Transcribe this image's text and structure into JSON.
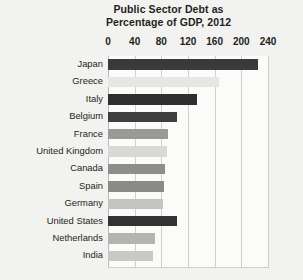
{
  "chart_data": {
    "type": "bar",
    "orientation": "horizontal",
    "title": "Public Sector Debt as Percentage of GDP, 2012",
    "title_lines": [
      "Public Sector Debt as",
      "Percentage of GDP, 2012"
    ],
    "xlabel": "",
    "ylabel": "",
    "xlim": [
      0,
      240
    ],
    "xticks": [
      0,
      40,
      80,
      120,
      160,
      200,
      240
    ],
    "xtick_labels": [
      "0",
      "40",
      "80",
      "120",
      "160",
      "200",
      "240"
    ],
    "grid": true,
    "grid_axis": "x",
    "legend": false,
    "categories": [
      "Japan",
      "Greece",
      "Italy",
      "Belgium",
      "France",
      "United Kingdom",
      "Canada",
      "Spain",
      "Germany",
      "United States",
      "Netherlands",
      "India"
    ],
    "values": [
      225,
      167,
      133,
      104,
      90,
      88,
      85,
      84,
      82,
      103,
      71,
      67
    ],
    "bar_colors": [
      "#3a3a3a",
      "#e6e6e4",
      "#2e2e2e",
      "#3f3f3f",
      "#9a9a98",
      "#d8d8d6",
      "#8e8e8c",
      "#8a8a88",
      "#c4c4c2",
      "#333333",
      "#b4b4b2",
      "#c9c9c7"
    ]
  },
  "style": {
    "page_background": "#f2f2f0",
    "plot_background": "#fbfbfa",
    "gridline_color": "#cfcfcb",
    "text_color": "#231f20"
  }
}
